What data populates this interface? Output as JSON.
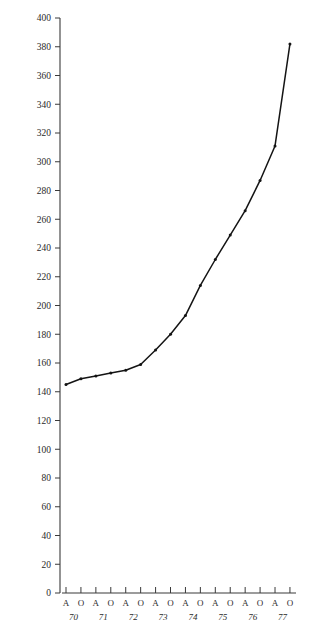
{
  "chart_data": {
    "type": "line",
    "title": "",
    "subtitle": "",
    "xlabel": "",
    "ylabel": "",
    "ylim": [
      0,
      400
    ],
    "ytick_step": 20,
    "grid": false,
    "legend": null,
    "line_color": "#141414",
    "axis_color": "#3a3a3a",
    "background": "#ffffff",
    "ytick_labels": [
      "0",
      "20",
      "40",
      "60",
      "80",
      "100",
      "120",
      "140",
      "160",
      "180",
      "200",
      "220",
      "240",
      "260",
      "280",
      "300",
      "320",
      "340",
      "360",
      "380",
      "400"
    ],
    "ytick_values": [
      0,
      20,
      40,
      60,
      80,
      100,
      120,
      140,
      160,
      180,
      200,
      220,
      240,
      260,
      280,
      300,
      320,
      340,
      360,
      380,
      400
    ],
    "xtick_labels": [
      "A",
      "O",
      "A",
      "O",
      "A",
      "O",
      "A",
      "O",
      "A",
      "O",
      "A",
      "O",
      "A",
      "O",
      "A",
      "O"
    ],
    "categories": [
      "A 70",
      "O 70",
      "A 71",
      "O 71",
      "A 72",
      "O 72",
      "A 73",
      "O 73",
      "A 74",
      "O 74",
      "A 75",
      "O 75",
      "A 76",
      "O 76",
      "A 77",
      "O 77"
    ],
    "year_labels": [
      "70",
      "71",
      "72",
      "73",
      "74",
      "75",
      "76",
      "77"
    ],
    "values": [
      145,
      149,
      151,
      153,
      155,
      159,
      169,
      180,
      193,
      214,
      232,
      249,
      266,
      287,
      311,
      382
    ],
    "series": [
      {
        "name": "series-1",
        "values": [
          145,
          149,
          151,
          153,
          155,
          159,
          169,
          180,
          193,
          214,
          232,
          249,
          266,
          287,
          311,
          382
        ]
      }
    ]
  }
}
